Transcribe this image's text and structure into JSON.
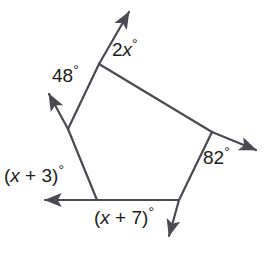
{
  "figure": {
    "kind": "polygon-exterior-angle-diagram",
    "shape": "pentagon",
    "background_color": "#ffffff",
    "stroke_color": "#4a4a52",
    "text_color": "#1c1c1c",
    "width": 276,
    "height": 253
  },
  "labels": {
    "top_angle": {
      "name": "2x-degrees",
      "coefficient": "2",
      "variable": "x",
      "degree_symbol": "°",
      "text": "2x°"
    },
    "upper_left_angle": {
      "name": "48-degrees",
      "value": "48",
      "degree_symbol": "°",
      "text": "48°"
    },
    "right_angle": {
      "name": "82-degrees",
      "value": "82",
      "degree_symbol": "°",
      "text": "82°"
    },
    "lower_left_angle": {
      "name": "x-plus-3-degrees",
      "open_paren": "(",
      "variable": "x",
      "operator": " + ",
      "constant": "3",
      "close_paren": ")",
      "degree_symbol": "°",
      "text": "(x + 3)°"
    },
    "bottom_angle": {
      "name": "x-plus-7-degrees",
      "open_paren": "(",
      "variable": "x",
      "operator": " + ",
      "constant": "7",
      "close_paren": ")",
      "degree_symbol": "°",
      "text": "(x + 7)°"
    }
  },
  "geometry": {
    "vertices": [
      {
        "id": "top",
        "x": 99,
        "y": 64
      },
      {
        "id": "right",
        "x": 212,
        "y": 132
      },
      {
        "id": "bottom-right",
        "x": 179,
        "y": 200
      },
      {
        "id": "bottom-left",
        "x": 97,
        "y": 200
      },
      {
        "id": "left",
        "x": 68,
        "y": 129
      }
    ],
    "polygon_edges": [
      {
        "from": "top",
        "to": "right"
      },
      {
        "from": "right",
        "to": "bottom-right"
      },
      {
        "from": "bottom-right",
        "to": "bottom-left"
      },
      {
        "from": "bottom-left",
        "to": "left"
      },
      {
        "from": "left",
        "to": "top"
      }
    ],
    "rays": [
      {
        "id": "ray-top",
        "from_vertex": "top",
        "tip_x": 127,
        "tip_y": 9,
        "direction": "up-right"
      },
      {
        "id": "ray-upper-left",
        "from_vertex": "left",
        "tip_x": 46,
        "tip_y": 90,
        "direction": "up-left"
      },
      {
        "id": "ray-right",
        "from_vertex": "right",
        "tip_x": 261,
        "tip_y": 152,
        "direction": "down-right"
      },
      {
        "id": "ray-bottom-left",
        "from_vertex": "bottom-left",
        "tip_x": 39,
        "tip_y": 200,
        "direction": "left"
      },
      {
        "id": "ray-bottom-right",
        "from_vertex": "bottom-right",
        "tip_x": 167,
        "tip_y": 241,
        "direction": "down-right"
      }
    ]
  }
}
